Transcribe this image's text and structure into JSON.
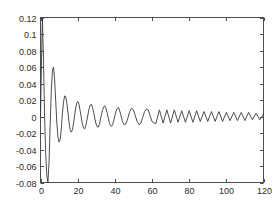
{
  "figure": {
    "background_color": "#ffffff",
    "axes_color": "#4d4d4d",
    "line_color": "#3a3a3a"
  },
  "chart_data": {
    "type": "line",
    "title": "",
    "subtitle": "",
    "xlabel": "",
    "ylabel": "",
    "xlim": [
      0,
      120
    ],
    "ylim": [
      -0.08,
      0.12
    ],
    "grid": false,
    "legend": [],
    "legend_position": "none",
    "box": true,
    "tick_direction": "in",
    "xticks": [
      0,
      20,
      40,
      60,
      80,
      100,
      120
    ],
    "xticklabels": [
      "0",
      "20",
      "40",
      "60",
      "80",
      "100",
      "120"
    ],
    "yticks": [
      -0.08,
      -0.06,
      -0.04,
      -0.02,
      0,
      0.02,
      0.04,
      0.06,
      0.08,
      0.1,
      0.12
    ],
    "yticklabels": [
      "-0.08",
      "-0.06",
      "-0.04",
      "-0.02",
      "0",
      "0.02",
      "0.04",
      "0.06",
      "0.08",
      "0.1",
      "0.12"
    ],
    "series": [
      {
        "name": "damped-oscillation",
        "x": [
          0,
          0.5,
          1,
          1.6,
          2.2,
          2.8,
          3.4,
          4,
          4.6,
          5.2,
          5.8,
          6.4,
          7,
          7.6,
          8.2,
          8.8,
          9.4,
          10,
          10.6,
          11.2,
          11.8,
          12.4,
          13,
          13.6,
          14.2,
          14.8,
          15.4,
          16,
          16.6,
          17.2,
          17.8,
          18.4,
          19,
          19.6,
          20.2,
          20.8,
          21.4,
          22,
          22.6,
          23.2,
          23.8,
          24.4,
          25,
          25.6,
          26.2,
          26.8,
          27.4,
          28,
          28.6,
          29.2,
          29.8,
          30.4,
          31,
          31.6,
          32.2,
          32.8,
          33.4,
          34,
          34.6,
          35.2,
          35.8,
          36.4,
          37,
          37.6,
          38.2,
          38.8,
          39.4,
          40,
          41,
          42,
          43,
          44,
          45,
          46,
          47,
          48,
          49,
          50,
          51,
          52,
          53,
          54,
          55,
          56,
          57,
          58,
          59,
          60,
          62,
          64,
          66,
          68,
          70,
          72,
          74,
          76,
          78,
          80,
          82,
          84,
          86,
          88,
          90,
          92,
          94,
          96,
          98,
          100,
          102,
          104,
          106,
          108,
          110,
          112,
          114,
          116,
          118,
          120
        ],
        "y": [
          0.0,
          0.06,
          0.12,
          0.07,
          0.0,
          -0.045,
          -0.072,
          -0.08,
          -0.055,
          -0.01,
          0.03,
          0.055,
          0.06,
          0.045,
          0.018,
          -0.008,
          -0.025,
          -0.031,
          -0.028,
          -0.015,
          0.004,
          0.018,
          0.025,
          0.024,
          0.016,
          0.004,
          -0.008,
          -0.016,
          -0.019,
          -0.016,
          -0.008,
          0.002,
          0.011,
          0.017,
          0.018,
          0.014,
          0.006,
          -0.002,
          -0.01,
          -0.014,
          -0.015,
          -0.011,
          -0.004,
          0.003,
          0.01,
          0.014,
          0.015,
          0.011,
          0.005,
          -0.002,
          -0.008,
          -0.012,
          -0.013,
          -0.01,
          -0.004,
          0.002,
          0.008,
          0.012,
          0.013,
          0.01,
          0.005,
          -0.001,
          -0.007,
          -0.011,
          -0.012,
          -0.01,
          -0.005,
          0.001,
          0.009,
          0.011,
          0.004,
          -0.005,
          -0.01,
          -0.009,
          -0.002,
          0.006,
          0.01,
          0.008,
          0.001,
          -0.006,
          -0.01,
          -0.008,
          -0.001,
          0.006,
          0.009,
          0.008,
          0.001,
          -0.006,
          -0.009,
          0.008,
          -0.008,
          0.008,
          -0.008,
          0.008,
          -0.007,
          0.007,
          -0.007,
          0.007,
          -0.007,
          0.007,
          -0.006,
          0.006,
          -0.006,
          0.006,
          -0.006,
          0.006,
          -0.006,
          0.005,
          -0.005,
          0.005,
          -0.005,
          0.005,
          -0.005,
          0.005,
          -0.004,
          0.004,
          -0.004,
          0.003
        ]
      }
    ]
  }
}
